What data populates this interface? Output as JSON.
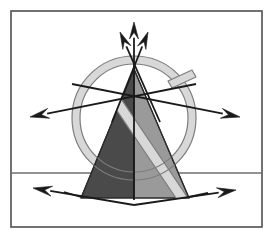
{
  "figure": {
    "canvas": {
      "width": 273,
      "height": 236,
      "background": "#ffffff"
    },
    "frame": {
      "x": 11,
      "y": 11,
      "width": 251,
      "height": 216,
      "stroke": "#4f4f4f",
      "stroke_width": 1.6,
      "fill": "#ffffff"
    },
    "ground_line": {
      "label": "horizon",
      "y": 173,
      "x1": 11,
      "x2": 262,
      "stroke": "#6e6e6e",
      "stroke_width": 1.3
    },
    "cone": {
      "label": "truncated cone",
      "apex_x": 134,
      "apex_y": 69,
      "base_y": 198,
      "base_left_x": 81,
      "base_right_x": 189,
      "left_face_color": "#4a4a4a",
      "right_face_color": "#9a9a9a",
      "outline": "#2b2b2b",
      "outline_width": 1.2
    },
    "ring": {
      "label": "torus ring",
      "center_x": 134,
      "center_y": 118,
      "outer_radius": 62,
      "inner_radius": 54,
      "fill": "#d8d8d8",
      "stroke": "#7d7d7d",
      "stroke_width": 1.2,
      "band_tilt_deg": -34
    },
    "colors": {
      "dark_gray": "#4a4a4a",
      "mid_gray": "#9a9a9a",
      "light_gray": "#d8d8d8",
      "outline_gray": "#7d7d7d",
      "arrow_black": "#1a1a1a",
      "frame_gray": "#4f4f4f",
      "white": "#ffffff"
    },
    "arrows": [
      {
        "name": "arrow-up-center",
        "direction": "up",
        "x1": 134,
        "y1": 200,
        "x2": 134,
        "y2": 22,
        "head_width": 9,
        "head_length": 17,
        "shaft_width": 1.8
      },
      {
        "name": "arrow-up-left",
        "direction": "up-left",
        "x1": 160,
        "y1": 122,
        "x2": 120,
        "y2": 32,
        "head_width": 9,
        "head_length": 17,
        "shaft_width": 1.8
      },
      {
        "name": "arrow-up-right",
        "direction": "up-right",
        "x1": 112,
        "y1": 122,
        "x2": 148,
        "y2": 32,
        "head_width": 9,
        "head_length": 17,
        "shaft_width": 1.8
      },
      {
        "name": "arrow-left-horizontal",
        "direction": "left",
        "x1": 196,
        "y1": 84,
        "x2": 30,
        "y2": 117,
        "head_width": 10,
        "head_length": 19,
        "shaft_width": 1.8
      },
      {
        "name": "arrow-right-horizontal",
        "direction": "right",
        "x1": 72,
        "y1": 84,
        "x2": 240,
        "y2": 117,
        "head_width": 10,
        "head_length": 19,
        "shaft_width": 1.8
      },
      {
        "name": "arrow-base-left",
        "direction": "left",
        "x1": 134,
        "y1": 205,
        "x2": 33,
        "y2": 188,
        "head_width": 10,
        "head_length": 19,
        "shaft_width": 1.8
      },
      {
        "name": "arrow-base-right",
        "direction": "right",
        "x1": 134,
        "y1": 205,
        "x2": 236,
        "y2": 190,
        "head_width": 10,
        "head_length": 19,
        "shaft_width": 1.8
      }
    ]
  }
}
